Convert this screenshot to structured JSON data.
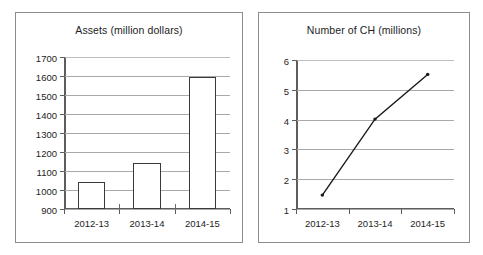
{
  "chart_data": [
    {
      "type": "bar",
      "title": "Assets (million dollars)",
      "categories": [
        "2012-13",
        "2013-14",
        "2014-15"
      ],
      "values": [
        1050,
        1150,
        1600
      ],
      "xlabel": "",
      "ylabel": "",
      "ylim": [
        900,
        1700
      ],
      "yticks": [
        900,
        1000,
        1100,
        1200,
        1300,
        1400,
        1500,
        1600,
        1700
      ],
      "ytick_labels": [
        "900",
        "1000",
        "1100",
        "1200",
        "1300",
        "1400",
        "1500",
        "1600",
        "1700"
      ],
      "grid": true,
      "legend": false,
      "bar_fill": "#ffffff",
      "bar_outline": "#3a3a3a"
    },
    {
      "type": "line",
      "title": "Number of CH (millions)",
      "categories": [
        "2012-13",
        "2013-14",
        "2014-15"
      ],
      "values": [
        1.5,
        4.05,
        5.55
      ],
      "xlabel": "",
      "ylabel": "",
      "ylim": [
        1,
        6
      ],
      "yticks": [
        1,
        2,
        3,
        4,
        5,
        6
      ],
      "ytick_labels": [
        "1",
        "2",
        "3",
        "4",
        "5",
        "6"
      ],
      "grid": true,
      "legend": false,
      "line_color": "#1a1a1a",
      "marker": "diamond"
    }
  ],
  "panels": {
    "assets": {
      "title": "Assets (million dollars)",
      "ytick_labels": [
        "1700",
        "1600",
        "1500",
        "1400",
        "1300",
        "1200",
        "1100",
        "1000",
        "900"
      ],
      "xtick_labels": [
        "2012-13",
        "2013-14",
        "2014-15"
      ]
    },
    "ch": {
      "title": "Number of CH (millions)",
      "ytick_labels": [
        "6",
        "5",
        "4",
        "3",
        "2",
        "1"
      ],
      "xtick_labels": [
        "2012-13",
        "2013-14",
        "2014-15"
      ]
    }
  },
  "colors": {
    "frame": "#8c8c8c",
    "axis": "#5d5d5d",
    "grid": "#a9a9a9",
    "ink": "#1a1a1a",
    "background": "#ffffff"
  }
}
